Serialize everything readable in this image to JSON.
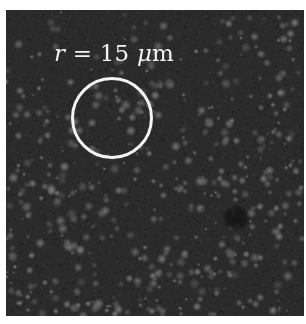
{
  "image": {
    "description": "Fluorescence microscopy image with scattered bright particles on a dark background",
    "background_color": "#2b2b2b",
    "particle_color": "#8a8a8a",
    "dark_spot": {
      "cx": 230,
      "cy": 208,
      "r": 14,
      "color": "#151515"
    }
  },
  "annotation": {
    "label_var": "r",
    "label_eq": " = 15 ",
    "label_unit_mu": "μ",
    "label_unit": "m",
    "circle": {
      "cx": 106,
      "cy": 108,
      "r": 41,
      "color": "#f4f4f4"
    }
  },
  "speckle": {
    "seed": 1337,
    "count": 520
  }
}
